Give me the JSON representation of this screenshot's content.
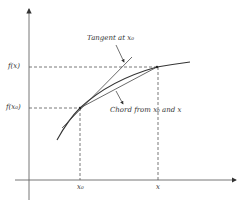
{
  "diagram": {
    "type": "function-graph",
    "axes": {
      "y_axis_label": "",
      "x_axis_label": ""
    },
    "y_labels": {
      "fx": "f(x)",
      "fx0": "f(x₀)"
    },
    "x_labels": {
      "x0": "x₀",
      "x": "x"
    },
    "annotations": {
      "tangent": "Tangent at x₀",
      "chord": "Chord from x₀ and x"
    },
    "colors": {
      "line": "#333333",
      "axis": "#555555",
      "dashed": "#555555"
    }
  }
}
